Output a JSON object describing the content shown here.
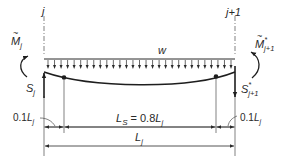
{
  "diagram": {
    "type": "beam-free-body-diagram",
    "colors": {
      "ink": "#1e1e1e",
      "thin_line": "#4a4a4a",
      "background": "#ffffff"
    },
    "supports": {
      "left": {
        "label": "j"
      },
      "right": {
        "label": "j+1"
      }
    },
    "load": {
      "label": "w",
      "arrow_count": 29
    },
    "moments": {
      "left": {
        "symbol": "M",
        "accent": "~",
        "subscript": "j",
        "superscript": ""
      },
      "right": {
        "symbol": "M",
        "accent": "~",
        "subscript": "j+1",
        "superscript": "*"
      }
    },
    "shears": {
      "left": {
        "symbol": "S",
        "subscript": "j",
        "superscript": ""
      },
      "right": {
        "symbol": "S",
        "subscript": "j+1",
        "superscript": "*"
      }
    },
    "dimensions": {
      "left_end": {
        "text_prefix": "0.1",
        "symbol": "L",
        "subscript": "j"
      },
      "span_segment": {
        "text_lhs_symbol": "L",
        "text_lhs_subscript": "S",
        "text_rhs": " = 0.8",
        "symbol": "L",
        "subscript": "j"
      },
      "right_end": {
        "text_prefix": "0.1",
        "symbol": "L",
        "subscript": "j"
      },
      "total": {
        "symbol": "L",
        "subscript": "j"
      }
    }
  }
}
